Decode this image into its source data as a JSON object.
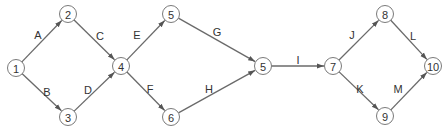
{
  "diagram": {
    "type": "activity-on-arrow network",
    "nodes": [
      {
        "id": "n1",
        "label": "1"
      },
      {
        "id": "n2",
        "label": "2"
      },
      {
        "id": "n3",
        "label": "3"
      },
      {
        "id": "n4",
        "label": "4"
      },
      {
        "id": "n5a",
        "label": "5"
      },
      {
        "id": "n6",
        "label": "6"
      },
      {
        "id": "n5b",
        "label": "5"
      },
      {
        "id": "n7",
        "label": "7"
      },
      {
        "id": "n8",
        "label": "8"
      },
      {
        "id": "n9",
        "label": "9"
      },
      {
        "id": "n10",
        "label": "10"
      }
    ],
    "edges": [
      {
        "label": "A",
        "from": "n1",
        "to": "n2"
      },
      {
        "label": "B",
        "from": "n1",
        "to": "n3"
      },
      {
        "label": "C",
        "from": "n2",
        "to": "n4"
      },
      {
        "label": "D",
        "from": "n3",
        "to": "n4"
      },
      {
        "label": "E",
        "from": "n4",
        "to": "n5a"
      },
      {
        "label": "F",
        "from": "n4",
        "to": "n6"
      },
      {
        "label": "G",
        "from": "n5a",
        "to": "n5b"
      },
      {
        "label": "H",
        "from": "n6",
        "to": "n5b"
      },
      {
        "label": "I",
        "from": "n5b",
        "to": "n7"
      },
      {
        "label": "J",
        "from": "n7",
        "to": "n8"
      },
      {
        "label": "K",
        "from": "n7",
        "to": "n9"
      },
      {
        "label": "L",
        "from": "n8",
        "to": "n10"
      },
      {
        "label": "M",
        "from": "n9",
        "to": "n10"
      }
    ]
  }
}
